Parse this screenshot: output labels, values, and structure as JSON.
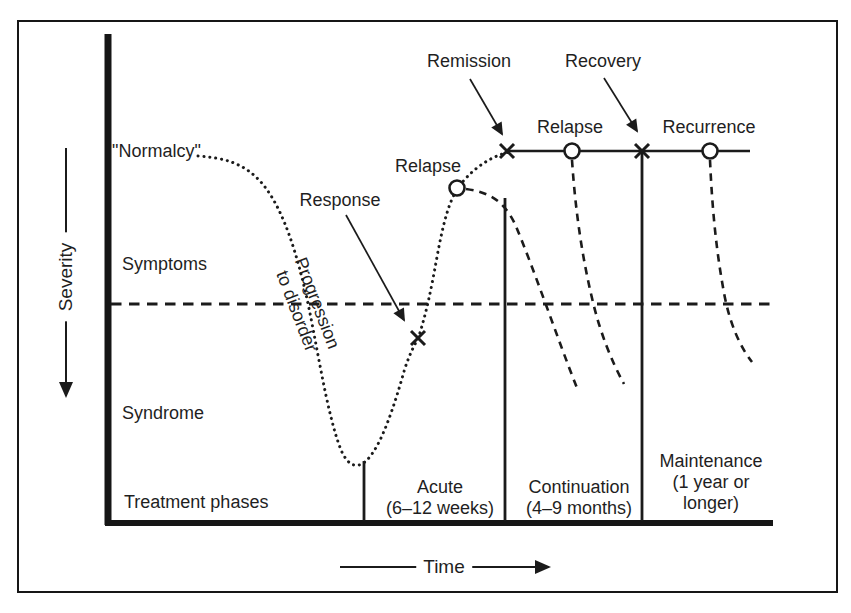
{
  "axes": {
    "y_label": "Severity",
    "x_label": "Time"
  },
  "severity_levels": {
    "normalcy": "\"Normalcy\"",
    "symptoms": "Symptoms",
    "syndrome": "Syndrome"
  },
  "curve_labels": {
    "progression_line1": "Progression",
    "progression_line2": "to disorder",
    "response": "Response",
    "relapse_first": "Relapse",
    "remission": "Remission",
    "relapse_second": "Relapse",
    "recovery": "Recovery",
    "recurrence": "Recurrence"
  },
  "treatment": {
    "row_label": "Treatment phases",
    "phases": [
      {
        "name": "Acute",
        "duration": "(6–12 weeks)"
      },
      {
        "name": "Continuation",
        "duration": "(4–9 months)"
      },
      {
        "name": "Maintenance",
        "duration_lines": [
          "(1 year or",
          "longer)"
        ]
      }
    ]
  },
  "colors": {
    "ink": "#1b1b1b",
    "paper": "#ffffff"
  }
}
